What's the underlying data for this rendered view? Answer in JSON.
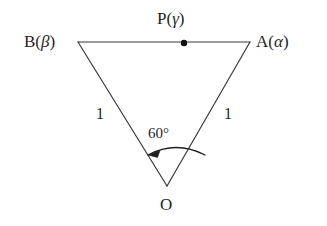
{
  "figure": {
    "background_color": "#ffffff",
    "stroke_color": "#3a3a3a",
    "text_color": "#1f1f1f",
    "vertices": {
      "A": {
        "label_main": "A",
        "label_paren": "(",
        "label_greek": "α",
        "label_paren_close": ")",
        "full": "A(α)",
        "x": 250,
        "y": 42
      },
      "B": {
        "label_main": "B",
        "label_paren": "(",
        "label_greek": "β",
        "label_paren_close": ")",
        "full": "B(β)",
        "x": 78,
        "y": 42
      },
      "O": {
        "label_main": "O",
        "full": "O",
        "x": 167,
        "y": 186
      },
      "P": {
        "label_main": "P",
        "label_paren": "(",
        "label_greek": "γ",
        "label_paren_close": ")",
        "full": "P(γ)",
        "x": 184,
        "y": 43,
        "marker": "filled-dot",
        "marker_radius": 3.2
      }
    },
    "sides": {
      "OB_label": "1",
      "OA_label": "1",
      "AB_label": ""
    },
    "angle": {
      "at_vertex": "O",
      "value": "60",
      "unit": "°",
      "full": "60°",
      "arc_direction": "from OA to OB",
      "arrowhead": "at OB end"
    },
    "edges": [
      {
        "name": "segment-BA",
        "from": "B",
        "to": "A"
      },
      {
        "name": "segment-BO",
        "from": "B",
        "to": "O"
      },
      {
        "name": "segment-AO",
        "from": "A",
        "to": "O"
      }
    ]
  }
}
